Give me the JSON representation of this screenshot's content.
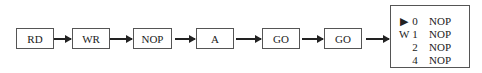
{
  "pipeline": {
    "stages": [
      {
        "label": "RD"
      },
      {
        "label": "WR"
      },
      {
        "label": "NOP"
      },
      {
        "label": "A"
      },
      {
        "label": "GO"
      },
      {
        "label": "GO"
      }
    ],
    "queue": {
      "rows": [
        {
          "marker": "▶",
          "index": "0",
          "op": "NOP"
        },
        {
          "marker": "W",
          "index": "1",
          "op": "NOP"
        },
        {
          "marker": "",
          "index": "2",
          "op": "NOP"
        },
        {
          "marker": "",
          "index": "4",
          "op": "NOP"
        }
      ]
    }
  }
}
